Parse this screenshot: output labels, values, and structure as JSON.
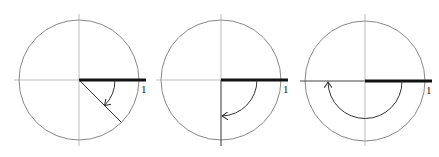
{
  "figure": {
    "colors": {
      "circle": "#888888",
      "axis": "#aaaaaa",
      "initial_side": "#111111",
      "terminal_side": "#333333",
      "arc": "#333333"
    },
    "panels": [
      {
        "name": "angle-minus-45",
        "center": [
          79,
          80
        ],
        "radius": 60,
        "angle_deg": -45,
        "arc_radius": 36,
        "unit_label": "1"
      },
      {
        "name": "angle-minus-90",
        "center": [
          221,
          80
        ],
        "radius": 60,
        "angle_deg": -90,
        "arc_radius": 36,
        "unit_label": "1"
      },
      {
        "name": "angle-minus-180",
        "center": [
          365,
          81
        ],
        "radius": 60,
        "angle_deg": -180,
        "arc_radius": 37,
        "unit_label": "1"
      }
    ]
  }
}
